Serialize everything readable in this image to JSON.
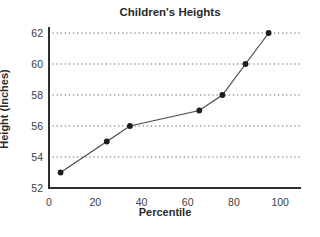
{
  "chart_data": {
    "type": "line",
    "title": "Children's Heights",
    "xlabel": "Percentile",
    "ylabel": "Height (Inches)",
    "x": [
      5,
      25,
      35,
      65,
      75,
      85,
      95
    ],
    "y": [
      53,
      55,
      56,
      57,
      58,
      60,
      62
    ],
    "x_ticks": [
      0,
      20,
      40,
      60,
      80,
      100
    ],
    "y_ticks": [
      52,
      54,
      56,
      58,
      60,
      62
    ],
    "gridline_values": [
      54,
      56,
      58,
      60,
      62
    ],
    "xlim": [
      0,
      109
    ],
    "ylim": [
      52,
      62
    ],
    "grid": "horizontal-dotted",
    "legend": "none",
    "marker": "filled-circle",
    "colors": {
      "background": "#ffffff",
      "axis": "#2d2d2d",
      "text": "#2b2b2b",
      "tick_text": "#3d3d3d",
      "line": "#4a4a4a",
      "marker": "#1e1e1e",
      "gridline": "#8f8f8f"
    }
  }
}
